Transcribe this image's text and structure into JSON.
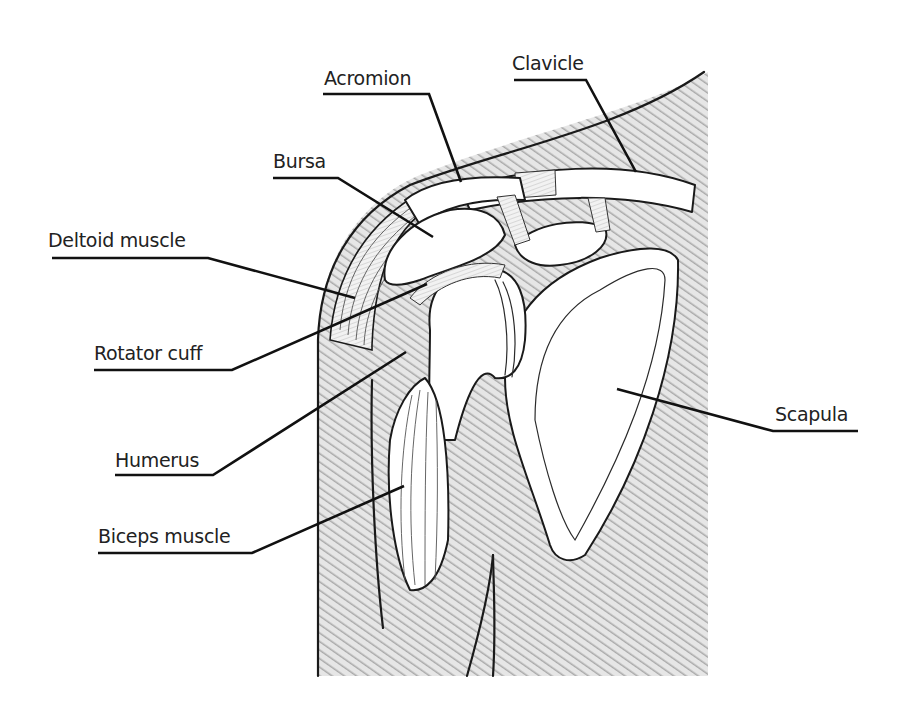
{
  "diagram": {
    "colors": {
      "line": "#1a1a1a",
      "hatch": "#b8b8b8",
      "background": "#ffffff"
    },
    "labels": [
      {
        "id": "acromion",
        "text": "Acromion"
      },
      {
        "id": "clavicle",
        "text": "Clavicle"
      },
      {
        "id": "bursa",
        "text": "Bursa"
      },
      {
        "id": "deltoid",
        "text": "Deltoid muscle"
      },
      {
        "id": "rotator",
        "text": "Rotator cuff"
      },
      {
        "id": "humerus",
        "text": "Humerus"
      },
      {
        "id": "biceps",
        "text": "Biceps muscle"
      },
      {
        "id": "scapula",
        "text": "Scapula"
      }
    ]
  }
}
